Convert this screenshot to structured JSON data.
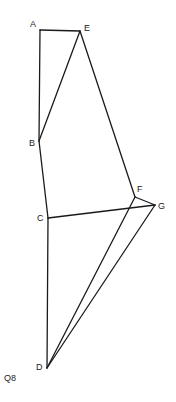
{
  "figure": {
    "caption": "Q8",
    "vertices": [
      {
        "id": "A",
        "label": "A"
      },
      {
        "id": "E",
        "label": "E"
      },
      {
        "id": "B",
        "label": "B"
      },
      {
        "id": "C",
        "label": "C"
      },
      {
        "id": "F",
        "label": "F"
      },
      {
        "id": "G",
        "label": "G"
      },
      {
        "id": "D",
        "label": "D"
      }
    ],
    "edges": [
      [
        "A",
        "E"
      ],
      [
        "A",
        "B"
      ],
      [
        "E",
        "B"
      ],
      [
        "E",
        "F"
      ],
      [
        "B",
        "C"
      ],
      [
        "C",
        "D"
      ],
      [
        "C",
        "G"
      ],
      [
        "F",
        "G"
      ],
      [
        "F",
        "D"
      ],
      [
        "G",
        "D"
      ]
    ],
    "line_color": "#1a1a1a"
  }
}
